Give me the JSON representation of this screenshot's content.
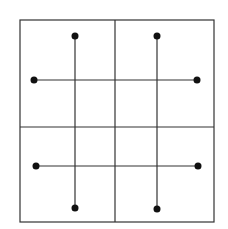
{
  "diagram": {
    "width": 228,
    "height": 229,
    "stroke_color": "#333333",
    "background": "#ffffff",
    "outer_box": {
      "x": 20,
      "y": 20,
      "w": 194,
      "h": 202
    },
    "dividers": {
      "vertical_x": 115,
      "horizontal_y": 127
    },
    "segments": [
      {
        "id": "v-left",
        "x1": 75,
        "y1": 36,
        "x2": 75,
        "y2": 208
      },
      {
        "id": "v-right",
        "x1": 157,
        "y1": 36,
        "x2": 157,
        "y2": 209
      },
      {
        "id": "h-top",
        "x1": 34,
        "y1": 80,
        "x2": 197,
        "y2": 80
      },
      {
        "id": "h-bottom",
        "x1": 36,
        "y1": 166,
        "x2": 198,
        "y2": 166
      }
    ],
    "dot_radius": 3.5
  }
}
